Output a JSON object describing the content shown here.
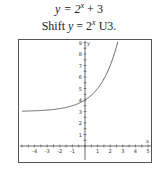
{
  "header": {
    "equation_prefix": "y = 2",
    "equation_exp": "x",
    "equation_suffix": " + 3",
    "desc_prefix": "Shift ",
    "desc_var": "y",
    "desc_eq": " = 2",
    "desc_exp": "x",
    "desc_suffix": " U3."
  },
  "chart_data": {
    "type": "line",
    "subtitle": "Shift y = 2^x U3.",
    "xlabel": "x",
    "ylabel": "y",
    "xlim": [
      -5,
      5
    ],
    "ylim": [
      0,
      9
    ],
    "x_ticks": [
      -4,
      -3,
      -2,
      -1,
      1,
      2,
      3,
      4,
      5
    ],
    "y_ticks": [
      1,
      2,
      3,
      4,
      5,
      6,
      7,
      8,
      9
    ],
    "grid": false,
    "series": [
      {
        "name": "y = 2^x + 3",
        "function": "2^x + 3",
        "x": [
          -5,
          -4,
          -3,
          -2,
          -1,
          0,
          1,
          2,
          2.58
        ],
        "y": [
          3.03,
          3.06,
          3.13,
          3.25,
          3.5,
          4,
          5,
          7,
          9
        ]
      }
    ],
    "horizontal_asymptote": 3
  },
  "colors": {
    "curve": "#555555",
    "axis": "#444444",
    "frame": "#555555"
  }
}
